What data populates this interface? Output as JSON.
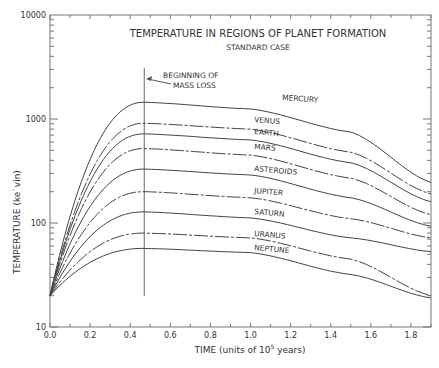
{
  "chart_data": {
    "type": "line",
    "title": "TEMPERATURE IN REGIONS OF PLANET FORMATION",
    "subtitle": "STANDARD CASE",
    "annotation": "BEGINNING OF MASS LOSS",
    "annotation_x": 0.47,
    "xlabel": "TIME (units of 10^5 years)",
    "ylabel": "TEMPERATURE (kelvin)",
    "y_scale": "log",
    "ylim": [
      10,
      10000
    ],
    "xlim": [
      0.0,
      1.9
    ],
    "x_ticks": [
      "0.0",
      "0.2",
      "0.4",
      "0.6",
      "0.8",
      "1.0",
      "1.2",
      "1.4",
      "1.6",
      "1.8"
    ],
    "y_ticks": [
      "10",
      "100",
      "1000",
      "10000"
    ],
    "grid": false,
    "x": [
      0.0,
      0.47,
      1.0,
      1.5,
      1.9
    ],
    "series": [
      {
        "name": "MERCURY",
        "values": [
          20,
          1450,
          1250,
          750,
          245
        ]
      },
      {
        "name": "VENUS",
        "values": [
          20,
          910,
          800,
          480,
          190
        ]
      },
      {
        "name": "EARTH",
        "values": [
          20,
          720,
          630,
          380,
          160
        ]
      },
      {
        "name": "MARS",
        "values": [
          20,
          520,
          450,
          270,
          120
        ]
      },
      {
        "name": "ASTEROIDS",
        "values": [
          20,
          330,
          290,
          175,
          93
        ]
      },
      {
        "name": "JUPITER",
        "values": [
          20,
          200,
          175,
          110,
          72
        ]
      },
      {
        "name": "SATURN",
        "values": [
          20,
          128,
          112,
          72,
          53
        ]
      },
      {
        "name": "URANUS",
        "values": [
          20,
          80,
          72,
          45,
          20
        ]
      },
      {
        "name": "NEPTUNE",
        "values": [
          20,
          57,
          52,
          32,
          19
        ]
      }
    ]
  },
  "labels": {
    "title": "TEMPERATURE IN REGIONS OF PLANET FORMATION",
    "subtitle": "STANDARD CASE",
    "annot1": "BEGINNING OF",
    "annot2": "MASS LOSS",
    "xlabel_main": "TIME (units of 10",
    "xlabel_exp": "5",
    "xlabel_end": " years)",
    "ylabel": "TEMPERATURE (kelvin)"
  }
}
